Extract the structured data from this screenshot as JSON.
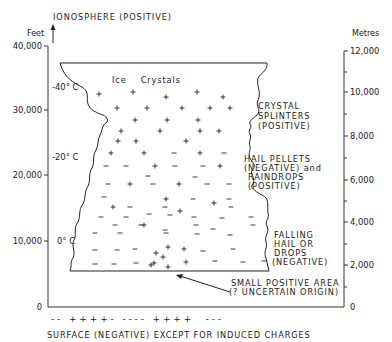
{
  "title_top": "IONOSPHERE (POSITIVE)",
  "left_axis": {
    "unit": "Feet",
    "ticks": [
      {
        "label": "40,000",
        "y": 46
      },
      {
        "label": "30,000",
        "y": 110
      },
      {
        "label": "20,000",
        "y": 175
      },
      {
        "label": "10,000",
        "y": 241
      },
      {
        "label": "0",
        "y": 307
      }
    ]
  },
  "right_axis": {
    "unit": "Metres",
    "ticks": [
      {
        "label": "12,000",
        "y": 51
      },
      {
        "label": "10,000",
        "y": 92
      },
      {
        "label": "8,000",
        "y": 136
      },
      {
        "label": "6,000",
        "y": 180
      },
      {
        "label": "4,000",
        "y": 222
      },
      {
        "label": "2,000",
        "y": 265
      },
      {
        "label": "0",
        "y": 307
      }
    ],
    "minor_ticks": [
      72,
      114,
      158,
      201,
      244,
      287
    ]
  },
  "temperatures": [
    {
      "label": "-40° C",
      "y": 87
    },
    {
      "label": "-20° C",
      "y": 157
    },
    {
      "label": "0° C",
      "y": 241
    }
  ],
  "cloud_title": "Ice    Crystals",
  "annotations": {
    "crystal_splinters": [
      "CRYSTAL",
      "SPLINTERS",
      "(POSITIVE)"
    ],
    "hail_pellets": [
      "HAIL PELLETS",
      "(NEGATIVE) and",
      "RAINDROPS",
      "(POSITIVE)"
    ],
    "falling_hail": [
      "FALLING",
      "HAIL OR",
      "DROPS",
      "(NEGATIVE)"
    ],
    "small_positive": [
      "SMALL POSITIVE AREA",
      "(? UNCERTAIN ORIGIN)"
    ]
  },
  "surface_charges": "- -   + + + + -   - - - -   + + + +     - - -",
  "surface_label": "SURFACE (NEGATIVE) EXCEPT FOR INDUCED CHARGES",
  "charges": {
    "plus": [
      [
        99,
        94
      ],
      [
        133,
        92
      ],
      [
        166,
        97
      ],
      [
        197,
        92
      ],
      [
        223,
        97
      ],
      [
        117,
        108
      ],
      [
        147,
        108
      ],
      [
        182,
        108
      ],
      [
        210,
        108
      ],
      [
        230,
        108
      ],
      [
        135,
        120
      ],
      [
        167,
        120
      ],
      [
        198,
        120
      ],
      [
        121,
        131
      ],
      [
        160,
        131
      ],
      [
        200,
        131
      ],
      [
        219,
        131
      ],
      [
        118,
        141
      ],
      [
        136,
        141
      ],
      [
        186,
        141
      ],
      [
        111,
        153
      ],
      [
        144,
        153
      ],
      [
        200,
        153
      ],
      [
        155,
        166
      ],
      [
        220,
        166
      ],
      [
        130,
        184
      ],
      [
        179,
        184
      ],
      [
        166,
        199
      ],
      [
        214,
        203
      ],
      [
        113,
        207
      ],
      [
        180,
        211
      ],
      [
        144,
        225
      ],
      [
        163,
        257
      ],
      [
        156,
        253
      ],
      [
        168,
        247
      ],
      [
        154,
        263
      ],
      [
        184,
        249
      ],
      [
        186,
        262
      ],
      [
        151,
        265
      ],
      [
        168,
        267
      ]
    ],
    "minus": [
      [
        174,
        153
      ],
      [
        224,
        153
      ],
      [
        106,
        166
      ],
      [
        126,
        166
      ],
      [
        175,
        166
      ],
      [
        203,
        166
      ],
      [
        148,
        176
      ],
      [
        195,
        177
      ],
      [
        108,
        184
      ],
      [
        153,
        184
      ],
      [
        207,
        184
      ],
      [
        229,
        184
      ],
      [
        104,
        197
      ],
      [
        193,
        199
      ],
      [
        229,
        199
      ],
      [
        130,
        207
      ],
      [
        165,
        207
      ],
      [
        231,
        207
      ],
      [
        101,
        217
      ],
      [
        126,
        217
      ],
      [
        149,
        214
      ],
      [
        170,
        215
      ],
      [
        194,
        217
      ],
      [
        222,
        218
      ],
      [
        251,
        217
      ],
      [
        115,
        225
      ],
      [
        141,
        225
      ],
      [
        165,
        230
      ],
      [
        196,
        225
      ],
      [
        213,
        229
      ],
      [
        253,
        225
      ],
      [
        95,
        233
      ],
      [
        120,
        233
      ],
      [
        166,
        233
      ],
      [
        197,
        234
      ],
      [
        230,
        235
      ],
      [
        95,
        250
      ],
      [
        117,
        250
      ],
      [
        135,
        249
      ],
      [
        203,
        251
      ],
      [
        233,
        249
      ],
      [
        95,
        264
      ],
      [
        114,
        264
      ],
      [
        136,
        263
      ],
      [
        215,
        261
      ],
      [
        243,
        262
      ],
      [
        264,
        261
      ]
    ]
  }
}
